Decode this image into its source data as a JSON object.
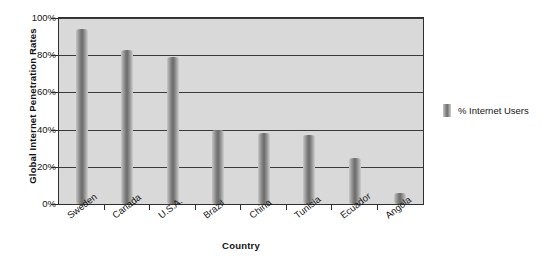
{
  "chart_data": {
    "type": "bar",
    "title": "",
    "xlabel": "Country",
    "ylabel": "Global Internet Penetration Rates",
    "categories": [
      "Sweden",
      "Canada",
      "U.S.A.",
      "Brazil",
      "China",
      "Tunisia",
      "Ecuador",
      "Angola"
    ],
    "series": [
      {
        "name": "% Internet Users",
        "values": [
          94,
          83,
          79,
          40,
          38,
          37,
          25,
          6
        ]
      }
    ],
    "ylim": [
      0,
      100
    ],
    "ytick_values": [
      0,
      20,
      40,
      60,
      80,
      100
    ],
    "ytick_labels": [
      "0%",
      "20%",
      "40%",
      "60%",
      "80%",
      "100%"
    ],
    "grid": "horizontal",
    "legend_position": "right",
    "colors": {
      "plot_background": "#d9d9d9",
      "page_background": "#ffffff",
      "bar_fill": "#6d6d6d",
      "bar_highlight": "#cfcfcf",
      "gridline": "#3a3a3a",
      "axis_border": "#2f2f2f",
      "text": "#151515"
    }
  },
  "legend": {
    "entries": [
      {
        "label": "% Internet Users"
      }
    ]
  },
  "axes": {
    "y_title": "Global Internet Penetration Rates",
    "x_title": "Country"
  }
}
